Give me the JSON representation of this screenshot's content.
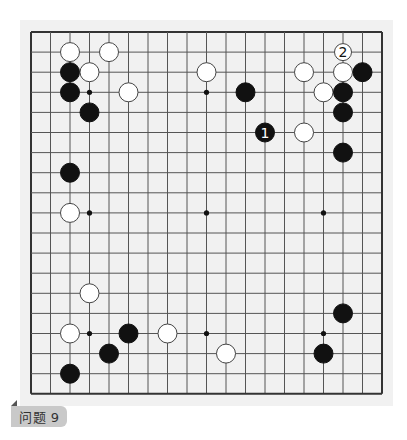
{
  "board": {
    "size": 19,
    "origin_x": 31,
    "origin_y": 32,
    "spacing_x": 19.5,
    "spacing_y": 20.1,
    "stone_radius": 9.5,
    "colors": {
      "panel": "#f1f1f1",
      "grid_line": "#555555",
      "border": "#333333",
      "black_stone": "#111111",
      "white_stone": "#ffffff",
      "white_stone_outline": "#444444"
    },
    "star_points": [
      [
        3,
        3
      ],
      [
        9,
        3
      ],
      [
        15,
        3
      ],
      [
        3,
        9
      ],
      [
        9,
        9
      ],
      [
        15,
        9
      ],
      [
        3,
        15
      ],
      [
        9,
        15
      ],
      [
        15,
        15
      ]
    ],
    "stones": [
      {
        "color": "white",
        "col": 2,
        "row": 1
      },
      {
        "color": "white",
        "col": 4,
        "row": 1
      },
      {
        "color": "black",
        "col": 2,
        "row": 2
      },
      {
        "color": "white",
        "col": 3,
        "row": 2
      },
      {
        "color": "black",
        "col": 2,
        "row": 3
      },
      {
        "color": "white",
        "col": 5,
        "row": 3
      },
      {
        "color": "black",
        "col": 3,
        "row": 4
      },
      {
        "color": "white",
        "col": 9,
        "row": 2
      },
      {
        "color": "black",
        "col": 11,
        "row": 3
      },
      {
        "color": "white",
        "col": 16,
        "row": 1,
        "label": "2"
      },
      {
        "color": "white",
        "col": 14,
        "row": 2
      },
      {
        "color": "white",
        "col": 16,
        "row": 2
      },
      {
        "color": "black",
        "col": 17,
        "row": 2
      },
      {
        "color": "white",
        "col": 15,
        "row": 3
      },
      {
        "color": "black",
        "col": 16,
        "row": 3
      },
      {
        "color": "black",
        "col": 16,
        "row": 4
      },
      {
        "color": "black",
        "col": 12,
        "row": 5,
        "label": "1"
      },
      {
        "color": "white",
        "col": 14,
        "row": 5
      },
      {
        "color": "black",
        "col": 16,
        "row": 6
      },
      {
        "color": "black",
        "col": 2,
        "row": 7
      },
      {
        "color": "white",
        "col": 2,
        "row": 9
      },
      {
        "color": "white",
        "col": 3,
        "row": 13
      },
      {
        "color": "black",
        "col": 16,
        "row": 14
      },
      {
        "color": "white",
        "col": 2,
        "row": 15
      },
      {
        "color": "black",
        "col": 5,
        "row": 15
      },
      {
        "color": "white",
        "col": 7,
        "row": 15
      },
      {
        "color": "black",
        "col": 4,
        "row": 16
      },
      {
        "color": "white",
        "col": 10,
        "row": 16
      },
      {
        "color": "black",
        "col": 15,
        "row": 16
      },
      {
        "color": "black",
        "col": 2,
        "row": 17
      }
    ]
  },
  "problem_label": "问题 9"
}
